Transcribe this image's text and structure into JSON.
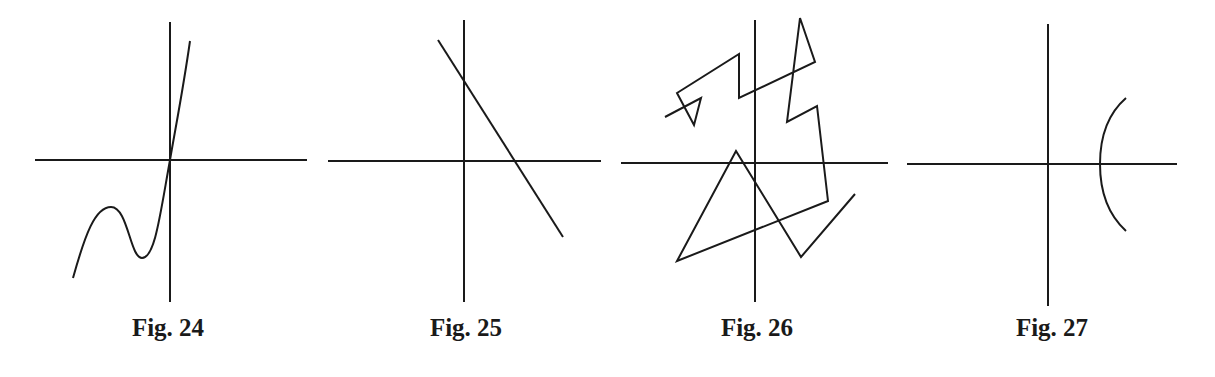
{
  "figures": [
    {
      "id": "fig24",
      "caption": "Fig. 24",
      "description": "Cubic-like curve with local max and local min left of y-axis, passing through origin, rising steeply",
      "axes": {
        "h": [
          35,
          160,
          307,
          160
        ],
        "v": [
          170,
          22,
          170,
          302
        ]
      },
      "path": "M73,278 C85,235 95,207 111,207 C128,207 130,258 142,258 C155,258 160,215 170,160 C176,125 183,90 190,41"
    },
    {
      "id": "fig25",
      "caption": "Fig. 25",
      "description": "Straight line with negative slope crossing positive y and positive x axes",
      "axes": {
        "h": [
          328,
          161,
          601,
          161
        ],
        "v": [
          464,
          20,
          464,
          302
        ]
      },
      "path": "M438,40 L563,237"
    },
    {
      "id": "fig26",
      "caption": "Fig. 26",
      "description": "Self-intersecting zigzag polyline (not a function graph)",
      "axes": {
        "h": [
          621,
          163,
          888,
          163
        ],
        "v": [
          755,
          20,
          755,
          302
        ]
      },
      "path": "M665,117 L701,98 L694,125 L677,93 L739,54 L739,98 L815,62 L800,18 L787,122 L817,106 L828,201 L677,261 L736,151 L801,257 L855,194"
    },
    {
      "id": "fig27",
      "caption": "Fig. 27",
      "description": "Left-opening arc crossing positive x-axis (not a function graph)",
      "axes": {
        "h": [
          907,
          164,
          1177,
          164
        ],
        "v": [
          1048,
          24,
          1048,
          306
        ]
      },
      "path": "M1126,98 C1103,118 1100,145 1100,164 C1100,183 1103,210 1126,231"
    }
  ],
  "captions": {
    "fig24": {
      "label": "Fig. 24",
      "x": 168
    },
    "fig25": {
      "label": "Fig. 25",
      "x": 466
    },
    "fig26": {
      "label": "Fig. 26",
      "x": 757
    },
    "fig27": {
      "label": "Fig. 27",
      "x": 1052
    }
  },
  "colors": {
    "ink": "#1a1a1a",
    "background": "#ffffff"
  }
}
